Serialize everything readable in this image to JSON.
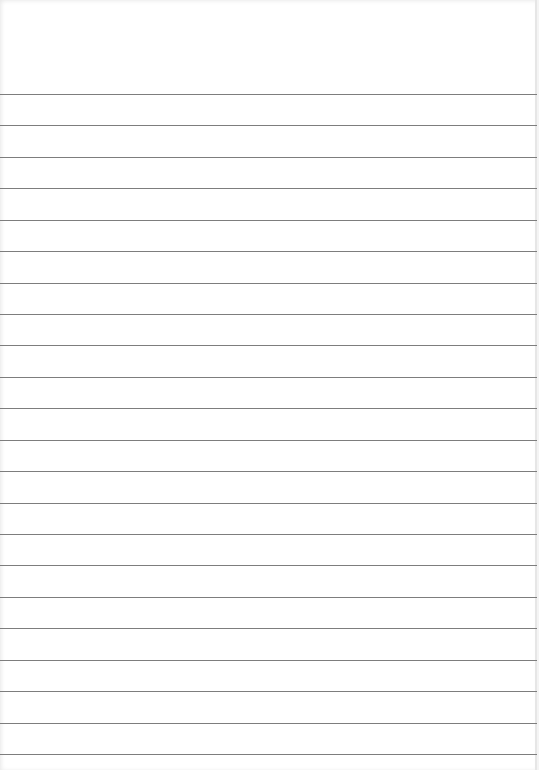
{
  "page": {
    "type": "lined-paper",
    "background_color": "#ffffff",
    "line_color": "#7d7d7d",
    "line_count": 22,
    "first_line_y": 94,
    "line_spacing": 31.43,
    "text_content": ""
  }
}
